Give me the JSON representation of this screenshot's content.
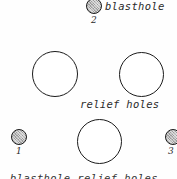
{
  "figure": {
    "background_color": "#fefefe",
    "outline_color": "#1b1b1b",
    "shaded_fill_color": "#b9b9b9",
    "text_color": "#2b2b2b"
  },
  "annotations": {
    "blasthole_label": "blasthole",
    "relief_holes_label": "relief holes",
    "clipped_caption": "blasthole    relief holes"
  },
  "holes": [
    {
      "id": "blasthole-2",
      "type": "blasthole",
      "number": "2",
      "diameter_px": 16,
      "center_x": 94,
      "center_y": 6
    },
    {
      "id": "relief-hole-upper-left",
      "type": "relief-hole",
      "number": "",
      "diameter_px": 46,
      "center_x": 55,
      "center_y": 74
    },
    {
      "id": "relief-hole-upper-right",
      "type": "relief-hole",
      "number": "",
      "diameter_px": 45,
      "center_x": 141,
      "center_y": 74
    },
    {
      "id": "relief-hole-lower-center",
      "type": "relief-hole",
      "number": "",
      "diameter_px": 45,
      "center_x": 100,
      "center_y": 141
    },
    {
      "id": "blasthole-1",
      "type": "blasthole",
      "number": "1",
      "diameter_px": 16,
      "center_x": 19,
      "center_y": 137
    },
    {
      "id": "blasthole-3",
      "type": "blasthole",
      "number": "3",
      "diameter_px": 16,
      "center_x": 173,
      "center_y": 137
    }
  ]
}
